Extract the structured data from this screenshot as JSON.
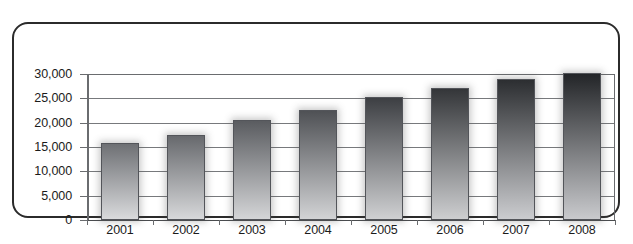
{
  "chart_data": {
    "type": "bar",
    "title": "",
    "subtitle": "",
    "xlabel": "",
    "ylabel": "",
    "categories": [
      "2001",
      "2002",
      "2003",
      "2004",
      "2005",
      "2006",
      "2007",
      "2008"
    ],
    "values": [
      15800,
      17500,
      20500,
      22700,
      25200,
      27200,
      28900,
      30200
    ],
    "ylim": [
      0,
      30000
    ],
    "ytick_values": [
      0,
      5000,
      10000,
      15000,
      20000,
      25000,
      30000
    ],
    "ytick_labels": [
      "0",
      "5,000",
      "10,000",
      "15,000",
      "20,000",
      "25,000",
      "30,000"
    ],
    "grid": true,
    "grid_axis": "y",
    "legend": false,
    "legend_position": "none",
    "series": [
      {
        "name": "",
        "values": [
          15800,
          17500,
          20500,
          22700,
          25200,
          27200,
          28900,
          30200
        ]
      }
    ],
    "bar_styles": [
      {
        "category": "2001",
        "top_color": "#6e7074",
        "bottom_color": "#d9dadc"
      },
      {
        "category": "2002",
        "top_color": "#67696d",
        "bottom_color": "#d7d8da"
      },
      {
        "category": "2003",
        "top_color": "#5a5c60",
        "bottom_color": "#d4d5d7"
      },
      {
        "category": "2004",
        "top_color": "#4f5155",
        "bottom_color": "#d2d3d5"
      },
      {
        "category": "2005",
        "top_color": "#3d3f43",
        "bottom_color": "#cfd0d2"
      },
      {
        "category": "2006",
        "top_color": "#343639",
        "bottom_color": "#cdced0"
      },
      {
        "category": "2007",
        "top_color": "#2c2e31",
        "bottom_color": "#cbcccf"
      },
      {
        "category": "2008",
        "top_color": "#232528",
        "bottom_color": "#c9cacd"
      }
    ]
  },
  "colors": {
    "frame_border": "#2b2b2b",
    "gridline": "#77797c",
    "axis_line": "#6a6c6f",
    "tick_label": "#1b1b1b",
    "background": "#ffffff"
  },
  "caption": {
    "text": ""
  }
}
